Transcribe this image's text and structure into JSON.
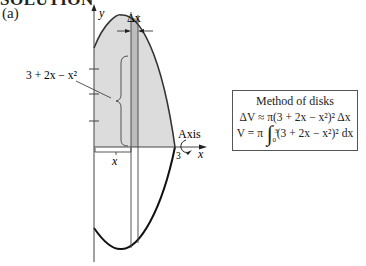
{
  "heading": "SOLUTION",
  "part_label": "(a)",
  "diagram": {
    "y_axis_label": "y",
    "x_axis_label": "x",
    "delta_x_label": "Δx",
    "function_label": "3 + 2x − x²",
    "x_distance_label": "x",
    "root_label": "3",
    "axis_label": "Axis",
    "shade_color": "#dcdcdc",
    "strip_color": "#b8b8b8"
  },
  "method_box": {
    "title": "Method of disks",
    "line1": "ΔV ≈ π(3 + 2x − x²)² Δx",
    "line2_prefix": "V = π",
    "line2_lower": "0",
    "line2_upper": "3",
    "line2_integrand": "(3 + 2x − x²)² dx"
  }
}
